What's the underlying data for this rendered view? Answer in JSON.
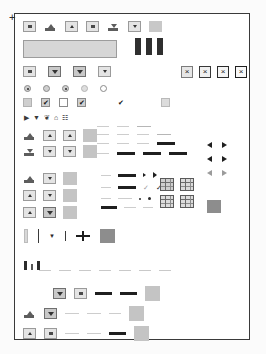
{
  "panel": {
    "name": "widget-gallery-panel",
    "border_color": "#3a3a3a",
    "background": "#ffffff",
    "cursor_marker": "+"
  },
  "toolbar": {
    "name": "top-toolbar",
    "buttons": [
      {
        "icon": "small-square-icon",
        "label": ""
      },
      {
        "icon": "ramp-up-icon",
        "label": ""
      },
      {
        "icon": "ramp-center-icon",
        "label": ""
      },
      {
        "icon": "small-square-icon",
        "label": ""
      },
      {
        "icon": "ramp-down-icon",
        "label": ""
      },
      {
        "icon": "small-square-icon",
        "label": ""
      },
      {
        "icon": "blank-swatch-icon",
        "label": ""
      }
    ]
  },
  "text_field": {
    "name": "text-input",
    "value": "",
    "placeholder": ""
  },
  "tab_bars": {
    "name": "dark-bar-group",
    "count": 3,
    "color": "#2f2f2f"
  },
  "close_buttons": {
    "name": "close-button-group",
    "items": [
      {
        "glyph": "×",
        "style": "light"
      },
      {
        "glyph": "×",
        "style": "bold"
      },
      {
        "glyph": "×",
        "style": "bolder"
      },
      {
        "glyph": "×",
        "style": "boldest"
      }
    ]
  },
  "dropdowns": {
    "name": "dropdown-row",
    "items": [
      {
        "glyph": "square",
        "state": "normal"
      },
      {
        "glyph": "chevron-down",
        "state": "pressed"
      },
      {
        "glyph": "chevron-down",
        "state": "pressed"
      },
      {
        "glyph": "chevron-down",
        "state": "normal"
      }
    ]
  },
  "radios": {
    "name": "radio-group",
    "items": [
      {
        "state": "selected"
      },
      {
        "state": "unselected"
      },
      {
        "state": "selected"
      },
      {
        "state": "disabled"
      },
      {
        "state": "empty"
      }
    ]
  },
  "checkboxes": {
    "name": "checkbox-group",
    "items": [
      {
        "state": "indeterminate",
        "glyph": ""
      },
      {
        "state": "checked",
        "glyph": "✔"
      },
      {
        "state": "unchecked",
        "glyph": ""
      },
      {
        "state": "checked",
        "glyph": "✔"
      },
      {
        "state": "checked-borderless",
        "glyph": "✔"
      },
      {
        "state": "disabled",
        "glyph": ""
      }
    ]
  },
  "tree_icons": {
    "name": "tree-icon-row",
    "items": [
      {
        "icon": "triangle-right-icon",
        "glyph": "▶"
      },
      {
        "icon": "triangle-down-icon",
        "glyph": "▼"
      },
      {
        "icon": "folder-open-icon",
        "glyph": "❦"
      },
      {
        "icon": "folder-icon",
        "glyph": "⌂"
      },
      {
        "icon": "document-icon",
        "glyph": "☷"
      }
    ]
  },
  "spinners": {
    "name": "spinner-grid",
    "rows": [
      {
        "items": [
          {
            "icon": "ramp-up-icon"
          },
          {
            "icon": "triangle-up-icon"
          },
          {
            "icon": "triangle-up-icon"
          },
          {
            "icon": "swatch"
          }
        ]
      },
      {
        "items": [
          {
            "icon": "ramp-down-icon"
          },
          {
            "icon": "triangle-down-icon"
          },
          {
            "icon": "triangle-down-icon"
          },
          {
            "icon": "swatch"
          }
        ]
      }
    ]
  },
  "spinners_b": {
    "name": "spinner-grid-secondary",
    "rows": [
      {
        "items": [
          {
            "icon": "ramp-up-icon"
          },
          {
            "icon": "triangle-down-icon"
          },
          {
            "icon": "swatch"
          }
        ]
      },
      {
        "items": [
          {
            "icon": "triangle-up-icon"
          },
          {
            "icon": "triangle-down-icon"
          },
          {
            "icon": "swatch"
          }
        ]
      },
      {
        "items": [
          {
            "icon": "triangle-up-icon"
          },
          {
            "icon": "triangle-down-icon"
          },
          {
            "icon": "swatch"
          }
        ]
      },
      {
        "items": [
          {
            "icon": "triangle-up-icon"
          },
          {
            "icon": "ramp-down-icon"
          },
          {
            "icon": "swatch"
          }
        ]
      }
    ]
  },
  "line_samples": {
    "name": "line-sample-block",
    "rows": [
      {
        "items": [
          "faint",
          "faint",
          "mid",
          "blank",
          "blank"
        ]
      },
      {
        "items": [
          "faint",
          "faint",
          "faint",
          "mid",
          "blank"
        ]
      },
      {
        "items": [
          "faint",
          "mid",
          "thick",
          "thick",
          "thick"
        ]
      },
      {
        "items": [
          "mid",
          "thick",
          "dot",
          "dot",
          "blank"
        ]
      },
      {
        "items": [
          "faint",
          "thick",
          "check",
          "check",
          "blank"
        ]
      },
      {
        "items": [
          "thick",
          "faint",
          "dot",
          "dot",
          "blank"
        ]
      }
    ]
  },
  "scroll_arrows": {
    "name": "scroll-arrow-pairs",
    "rows": [
      {
        "left": "◀",
        "right": "▶",
        "state": "normal"
      },
      {
        "left": "◀",
        "right": "▶",
        "state": "normal"
      },
      {
        "left": "◀",
        "right": "▶",
        "state": "disabled"
      }
    ]
  },
  "table_icons": {
    "name": "table-icon-grid",
    "rows": [
      {
        "items": [
          "grid-header-icon",
          "grid-icon"
        ]
      },
      {
        "items": [
          "grid-icon",
          "grid-icon"
        ]
      }
    ],
    "swatch": "dark-swatch"
  },
  "splitters": {
    "name": "splitter-row",
    "items": [
      {
        "icon": "vertical-grip-icon"
      },
      {
        "icon": "vertical-rule-icon"
      },
      {
        "icon": "caret-down-icon",
        "glyph": "▼"
      },
      {
        "icon": "vertical-rule-icon"
      },
      {
        "icon": "split-handle-icon",
        "glyph": "─|─"
      },
      {
        "icon": "dark-swatch-icon"
      }
    ]
  },
  "status_bar": {
    "name": "status-bar-row",
    "bars": [
      {
        "style": "tall"
      },
      {
        "style": "short"
      },
      {
        "style": "tall"
      }
    ],
    "dashes": 7
  },
  "bottom_block": {
    "name": "bottom-control-block",
    "rows": [
      {
        "items": [
          {
            "icon": "blank"
          },
          {
            "icon": "triangle-down-button"
          },
          {
            "icon": "square-button"
          },
          {
            "icon": "thick-line"
          },
          {
            "icon": "thick-line"
          },
          {
            "icon": "swatch"
          }
        ]
      },
      {
        "items": [
          {
            "icon": "ramp-up-button"
          },
          {
            "icon": "triangle-down-button-pressed"
          },
          {
            "icon": "faint-line"
          },
          {
            "icon": "faint-line"
          },
          {
            "icon": "faint-line"
          },
          {
            "icon": "swatch"
          }
        ]
      },
      {
        "items": [
          {
            "icon": "triangle-up-button"
          },
          {
            "icon": "square-button"
          },
          {
            "icon": "faint-line"
          },
          {
            "icon": "faint-line"
          },
          {
            "icon": "thick-line"
          },
          {
            "icon": "swatch"
          }
        ]
      }
    ]
  }
}
